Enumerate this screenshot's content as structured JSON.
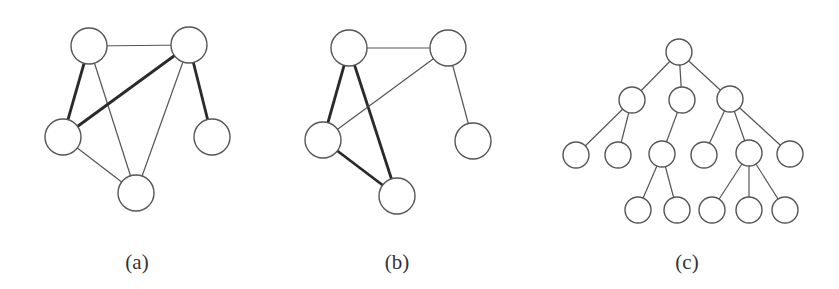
{
  "figure": {
    "panels": [
      {
        "id": "a",
        "label": "(a)",
        "label_x": 137,
        "node_radius": 18,
        "nodes": [
          {
            "id": "tl",
            "x": 89,
            "y": 46
          },
          {
            "id": "tr",
            "x": 189,
            "y": 45
          },
          {
            "id": "l",
            "x": 63,
            "y": 137
          },
          {
            "id": "r",
            "x": 212,
            "y": 137
          },
          {
            "id": "b",
            "x": 136,
            "y": 193
          }
        ],
        "edges": [
          {
            "from": "tl",
            "to": "tr",
            "weight": "thin"
          },
          {
            "from": "tl",
            "to": "l",
            "weight": "thick"
          },
          {
            "from": "tl",
            "to": "b",
            "weight": "thin"
          },
          {
            "from": "tr",
            "to": "l",
            "weight": "thick"
          },
          {
            "from": "tr",
            "to": "b",
            "weight": "thin"
          },
          {
            "from": "tr",
            "to": "r",
            "weight": "thick"
          },
          {
            "from": "l",
            "to": "b",
            "weight": "thin"
          }
        ]
      },
      {
        "id": "b",
        "label": "(b)",
        "label_x": 397,
        "node_radius": 18,
        "nodes": [
          {
            "id": "tl",
            "x": 349,
            "y": 48
          },
          {
            "id": "tr",
            "x": 448,
            "y": 48
          },
          {
            "id": "l",
            "x": 323,
            "y": 140
          },
          {
            "id": "r",
            "x": 473,
            "y": 141
          },
          {
            "id": "b",
            "x": 397,
            "y": 196
          }
        ],
        "edges": [
          {
            "from": "tl",
            "to": "tr",
            "weight": "thin"
          },
          {
            "from": "tl",
            "to": "l",
            "weight": "thick"
          },
          {
            "from": "tl",
            "to": "b",
            "weight": "thick"
          },
          {
            "from": "tr",
            "to": "l",
            "weight": "thin"
          },
          {
            "from": "tr",
            "to": "r",
            "weight": "thin"
          },
          {
            "from": "l",
            "to": "b",
            "weight": "thick"
          }
        ]
      },
      {
        "id": "c",
        "label": "(c)",
        "label_x": 687,
        "node_radius": 13,
        "nodes": [
          {
            "id": "root",
            "x": 679,
            "y": 52
          },
          {
            "id": "a1",
            "x": 632,
            "y": 100
          },
          {
            "id": "a2",
            "x": 682,
            "y": 100
          },
          {
            "id": "a3",
            "x": 730,
            "y": 99
          },
          {
            "id": "b1",
            "x": 576,
            "y": 155
          },
          {
            "id": "b2",
            "x": 618,
            "y": 155
          },
          {
            "id": "b3",
            "x": 662,
            "y": 154
          },
          {
            "id": "b4",
            "x": 704,
            "y": 155
          },
          {
            "id": "b5",
            "x": 749,
            "y": 153
          },
          {
            "id": "b6",
            "x": 790,
            "y": 154
          },
          {
            "id": "c1",
            "x": 638,
            "y": 210
          },
          {
            "id": "c2",
            "x": 677,
            "y": 210
          },
          {
            "id": "c3",
            "x": 712,
            "y": 210
          },
          {
            "id": "c4",
            "x": 749,
            "y": 210
          },
          {
            "id": "c5",
            "x": 785,
            "y": 210
          }
        ],
        "edges": [
          {
            "from": "root",
            "to": "a1",
            "weight": "thin"
          },
          {
            "from": "root",
            "to": "a2",
            "weight": "thin"
          },
          {
            "from": "root",
            "to": "a3",
            "weight": "thin"
          },
          {
            "from": "a1",
            "to": "b1",
            "weight": "thin"
          },
          {
            "from": "a1",
            "to": "b2",
            "weight": "thin"
          },
          {
            "from": "a2",
            "to": "b3",
            "weight": "thin"
          },
          {
            "from": "a3",
            "to": "b4",
            "weight": "thin"
          },
          {
            "from": "a3",
            "to": "b5",
            "weight": "thin"
          },
          {
            "from": "a3",
            "to": "b6",
            "weight": "thin"
          },
          {
            "from": "b3",
            "to": "c1",
            "weight": "thin"
          },
          {
            "from": "b3",
            "to": "c2",
            "weight": "thin"
          },
          {
            "from": "b5",
            "to": "c3",
            "weight": "thin"
          },
          {
            "from": "b5",
            "to": "c4",
            "weight": "thin"
          },
          {
            "from": "b5",
            "to": "c5",
            "weight": "thin"
          }
        ]
      }
    ]
  }
}
